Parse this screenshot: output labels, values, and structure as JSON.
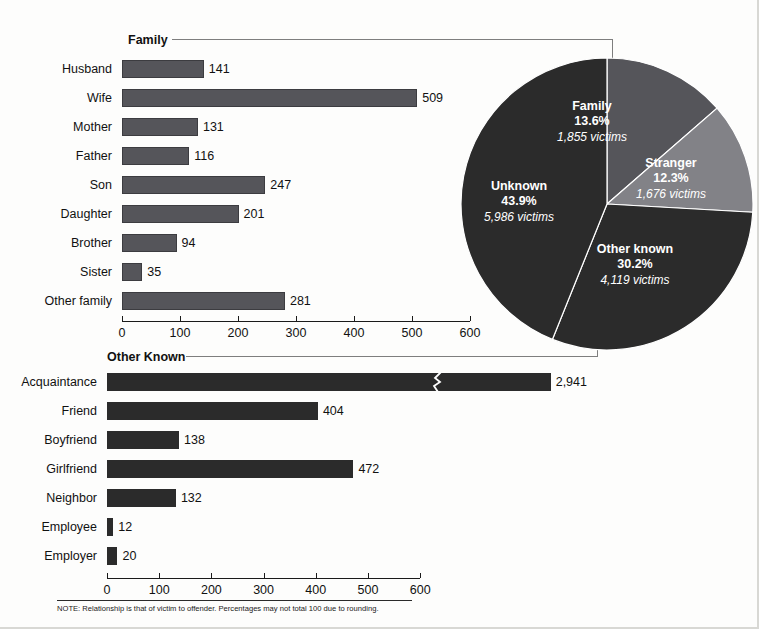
{
  "chart_data": [
    {
      "type": "bar",
      "title": "Family",
      "orientation": "horizontal",
      "categories": [
        "Husband",
        "Wife",
        "Mother",
        "Father",
        "Son",
        "Daughter",
        "Brother",
        "Sister",
        "Other family"
      ],
      "values": [
        141,
        509,
        131,
        116,
        247,
        201,
        94,
        35,
        281
      ],
      "value_labels": [
        "141",
        "509",
        "131",
        "116",
        "247",
        "201",
        "94",
        "35",
        "281"
      ],
      "xlabel": "",
      "ylabel": "",
      "xlim": [
        0,
        600
      ],
      "xticks": [
        0,
        100,
        200,
        300,
        400,
        500,
        600
      ],
      "xtick_labels": [
        "0",
        "100",
        "200",
        "300",
        "400",
        "500",
        "600"
      ],
      "grid": false,
      "legend": false,
      "bar_color": "#55555a"
    },
    {
      "type": "bar",
      "title": "Other Known",
      "orientation": "horizontal",
      "categories": [
        "Acquaintance",
        "Friend",
        "Boyfriend",
        "Girlfriend",
        "Neighbor",
        "Employee",
        "Employer"
      ],
      "values": [
        2941,
        404,
        138,
        472,
        132,
        12,
        20
      ],
      "value_labels": [
        "2,941",
        "404",
        "138",
        "472",
        "132",
        "12",
        "20"
      ],
      "axis_break": {
        "category": "Acquaintance",
        "note": "bar truncated with zigzag break"
      },
      "xlabel": "",
      "ylabel": "",
      "xlim": [
        0,
        600
      ],
      "xticks": [
        0,
        100,
        200,
        300,
        400,
        500,
        600
      ],
      "xtick_labels": [
        "0",
        "100",
        "200",
        "300",
        "400",
        "500",
        "600"
      ],
      "grid": false,
      "legend": false,
      "bar_color": "#2b2b2b"
    },
    {
      "type": "pie",
      "title": "",
      "labels": [
        "Family",
        "Stranger",
        "Other known",
        "Unknown"
      ],
      "percent_labels": [
        "13.6%",
        "12.3%",
        "30.2%",
        "43.9%"
      ],
      "values": [
        13.6,
        12.3,
        30.2,
        43.9
      ],
      "victim_labels": [
        "1,855 victims",
        "1,676 victims",
        "4,119 victims",
        "5,986 victims"
      ],
      "victims": [
        1855,
        1676,
        4119,
        5986
      ],
      "colors": [
        "#55555a",
        "#828287",
        "#2b2b2b",
        "#2b2b2b"
      ],
      "legend": false
    }
  ],
  "family_panel": {
    "title": "Family",
    "rows": [
      {
        "label": "Husband",
        "value": 141,
        "value_label": "141"
      },
      {
        "label": "Wife",
        "value": 509,
        "value_label": "509"
      },
      {
        "label": "Mother",
        "value": 131,
        "value_label": "131"
      },
      {
        "label": "Father",
        "value": 116,
        "value_label": "116"
      },
      {
        "label": "Son",
        "value": 247,
        "value_label": "247"
      },
      {
        "label": "Daughter",
        "value": 201,
        "value_label": "201"
      },
      {
        "label": "Brother",
        "value": 94,
        "value_label": "94"
      },
      {
        "label": "Sister",
        "value": 35,
        "value_label": "35"
      },
      {
        "label": "Other family",
        "value": 281,
        "value_label": "281"
      }
    ],
    "axis": {
      "ticks": [
        "0",
        "100",
        "200",
        "300",
        "400",
        "500",
        "600"
      ]
    }
  },
  "other_known_panel": {
    "title": "Other Known",
    "rows": [
      {
        "label": "Acquaintance",
        "value": 2941,
        "value_label": "2,941",
        "broken": true
      },
      {
        "label": "Friend",
        "value": 404,
        "value_label": "404",
        "broken": false
      },
      {
        "label": "Boyfriend",
        "value": 138,
        "value_label": "138",
        "broken": false
      },
      {
        "label": "Girlfriend",
        "value": 472,
        "value_label": "472",
        "broken": false
      },
      {
        "label": "Neighbor",
        "value": 132,
        "value_label": "132",
        "broken": false
      },
      {
        "label": "Employee",
        "value": 12,
        "value_label": "12",
        "broken": false
      },
      {
        "label": "Employer",
        "value": 20,
        "value_label": "20",
        "broken": false
      }
    ],
    "axis": {
      "ticks": [
        "0",
        "100",
        "200",
        "300",
        "400",
        "500",
        "600"
      ]
    }
  },
  "pie_panel": {
    "slices": [
      {
        "name": "Family",
        "percent": "13.6%",
        "victims": "1,855 victims"
      },
      {
        "name": "Stranger",
        "percent": "12.3%",
        "victims": "1,676 victims"
      },
      {
        "name": "Other known",
        "percent": "30.2%",
        "victims": "4,119 victims"
      },
      {
        "name": "Unknown",
        "percent": "43.9%",
        "victims": "5,986 victims"
      }
    ]
  },
  "footer": {
    "note": "NOTE: Relationship is that of victim to offender. Percentages may not total 100 due to rounding."
  }
}
